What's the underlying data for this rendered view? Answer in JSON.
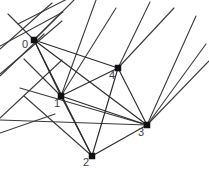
{
  "figure": {
    "title": "",
    "type": "geometric-graph",
    "width": 209,
    "height": 176,
    "background_color": "#ffffff",
    "edge_color": "#2b2b2b",
    "node_color": "#101010",
    "label_color": "#3d3d3d"
  },
  "nodes": [
    {
      "id": "0",
      "label": "0",
      "x": 34,
      "y": 40,
      "label_x": 25,
      "label_y": 40
    },
    {
      "id": "1",
      "label": "1",
      "x": 61,
      "y": 96,
      "label_x": 57,
      "label_y": 99
    },
    {
      "id": "2",
      "label": "2",
      "x": 92,
      "y": 156,
      "label_x": 86,
      "label_y": 158
    },
    {
      "id": "3",
      "label": "3",
      "x": 147,
      "y": 125,
      "label_x": 141,
      "label_y": 128
    },
    {
      "id": "4",
      "label": "4",
      "x": 118,
      "y": 68,
      "label_x": 112,
      "label_y": 71
    }
  ],
  "edges": [
    {
      "from": "0",
      "to": "1"
    },
    {
      "from": "0",
      "to": "2"
    },
    {
      "from": "0",
      "to": "3"
    },
    {
      "from": "0",
      "to": "4"
    },
    {
      "from": "1",
      "to": "2"
    },
    {
      "from": "1",
      "to": "3"
    },
    {
      "from": "1",
      "to": "4"
    },
    {
      "from": "2",
      "to": "3"
    },
    {
      "from": "2",
      "to": "4"
    },
    {
      "from": "3",
      "to": "4"
    }
  ],
  "rays": [
    {
      "x1": 18,
      "y1": 24,
      "x2": 77,
      "y2": -6
    },
    {
      "x1": 34,
      "y1": 40,
      "x2": 8,
      "y2": 14
    },
    {
      "x1": 34,
      "y1": 40,
      "x2": 62,
      "y2": 12
    },
    {
      "x1": 34,
      "y1": 40,
      "x2": 74,
      "y2": 0
    },
    {
      "x1": 0,
      "y1": 46,
      "x2": 63,
      "y2": 12
    },
    {
      "x1": 0,
      "y1": 49,
      "x2": 52,
      "y2": 3
    },
    {
      "x1": 61,
      "y1": 96,
      "x2": 116,
      "y2": 8
    },
    {
      "x1": 61,
      "y1": 96,
      "x2": 96,
      "y2": 0
    },
    {
      "x1": 61,
      "y1": 96,
      "x2": 24,
      "y2": 59
    },
    {
      "x1": 0,
      "y1": 74,
      "x2": 62,
      "y2": 21
    },
    {
      "x1": 0,
      "y1": 76,
      "x2": 44,
      "y2": 34
    },
    {
      "x1": 118,
      "y1": 68,
      "x2": 174,
      "y2": 8
    },
    {
      "x1": 118,
      "y1": 68,
      "x2": 150,
      "y2": 2
    },
    {
      "x1": 147,
      "y1": 125,
      "x2": 209,
      "y2": 61
    },
    {
      "x1": 147,
      "y1": 125,
      "x2": 206,
      "y2": 44
    },
    {
      "x1": 147,
      "y1": 125,
      "x2": 196,
      "y2": 16
    },
    {
      "x1": 0,
      "y1": 118,
      "x2": 62,
      "y2": 60
    },
    {
      "x1": 0,
      "y1": 133,
      "x2": 55,
      "y2": 114
    },
    {
      "x1": 0,
      "y1": 120,
      "x2": 147,
      "y2": 125
    },
    {
      "x1": 24,
      "y1": 96,
      "x2": 92,
      "y2": 156
    },
    {
      "x1": 20,
      "y1": 88,
      "x2": 147,
      "y2": 125
    }
  ],
  "accessibility": {
    "description": "Line drawing of a planar geometric graph with five square nodes labeled 0 through 4 connected by straight segments, with additional rays extending past the image border."
  }
}
